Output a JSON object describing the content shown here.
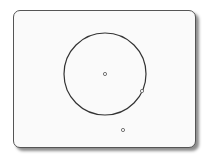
{
  "diagram": {
    "frame": {
      "x": 13,
      "y": 10,
      "width": 184,
      "height": 139,
      "border_color": "#555555",
      "fill_color": "#fafafa",
      "corner_radius": 7
    },
    "circle": {
      "cx": 105,
      "cy": 74,
      "r": 41,
      "stroke_color": "#333333",
      "stroke_width": 1.2
    },
    "points": [
      {
        "id": "center-point",
        "x": 105,
        "y": 74,
        "location": "center of circle"
      },
      {
        "id": "point-on-circle",
        "x": 142,
        "y": 91,
        "location": "on circumference"
      },
      {
        "id": "point-outside",
        "x": 123,
        "y": 130,
        "location": "outside circle"
      }
    ],
    "point_style": {
      "r": 1.6,
      "stroke_color": "#666666",
      "fill_color": "#ffffff"
    }
  }
}
